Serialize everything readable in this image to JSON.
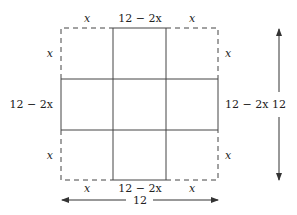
{
  "diagram": {
    "corner_label": "x",
    "middle_label": "12 − 2x",
    "total_label": "12",
    "top_labels": [
      "x",
      "12 − 2x",
      "x"
    ],
    "bottom_labels": [
      "x",
      "12 − 2x",
      "x"
    ],
    "left_labels": [
      "x",
      "12 − 2x",
      "x"
    ],
    "right_labels": [
      "x",
      "12 − 2x",
      "x"
    ],
    "horizontal_dimension": "12",
    "vertical_dimension": "12",
    "colors": {
      "line": "#444444",
      "text": "#222222"
    }
  }
}
